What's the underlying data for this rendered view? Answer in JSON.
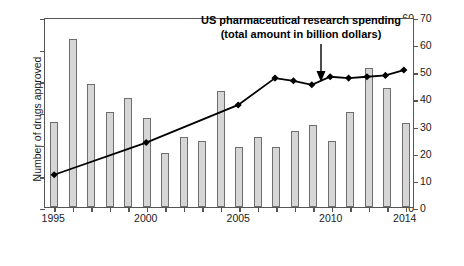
{
  "chart_data": {
    "type": "bar",
    "title": "",
    "annotation": {
      "line1": "US pharmaceutical research spending",
      "line2": "(total amount in billion dollars)",
      "points_to_year": 2010,
      "arrow": "down-arrow"
    },
    "categories": [
      1995,
      1996,
      1997,
      1998,
      1999,
      2000,
      2001,
      2002,
      2003,
      2004,
      2005,
      2006,
      2007,
      2008,
      2009,
      2010,
      2011,
      2012,
      2013,
      2014
    ],
    "xlabel": "",
    "xtick_labels": [
      "1995",
      "2000",
      "2005",
      "2010",
      "2014"
    ],
    "xlim": [
      1994.5,
      2014.5
    ],
    "series": [
      {
        "name": "Number of drugs approved",
        "type": "bar",
        "axis": "left",
        "color": "#d6d6d6",
        "edgecolor": "#6e6e6e",
        "values": [
          27,
          53,
          39,
          30,
          34.5,
          28,
          17,
          22,
          21,
          36.5,
          19,
          22,
          19,
          24,
          26,
          21,
          30,
          44,
          37.5,
          26.5
        ]
      },
      {
        "name": "US pharmaceutical research spending",
        "type": "line",
        "axis": "right",
        "color": "#000000",
        "marker": "diamond",
        "values": [
          12,
          null,
          null,
          null,
          null,
          24,
          null,
          null,
          null,
          null,
          38,
          null,
          48,
          47,
          45.5,
          48.5,
          48,
          48.5,
          49,
          51
        ],
        "marker_years": [
          1995,
          2000,
          2005,
          2007,
          2008,
          2009,
          2010,
          2011,
          2012,
          2013,
          2014
        ],
        "marker_values": [
          12,
          24,
          38,
          48,
          47,
          45.5,
          48.5,
          48,
          48.5,
          49,
          51
        ]
      }
    ],
    "left_axis": {
      "label": "Number of drugs approved",
      "ticks": [
        0,
        10,
        20,
        30,
        40,
        50,
        60
      ],
      "lim": [
        0,
        60
      ]
    },
    "right_axis": {
      "label": "Expenditures (billion dollar)",
      "ticks": [
        0,
        10,
        20,
        30,
        40,
        50,
        60,
        70
      ],
      "lim": [
        0,
        70
      ]
    },
    "grid": false,
    "legend": "none"
  }
}
